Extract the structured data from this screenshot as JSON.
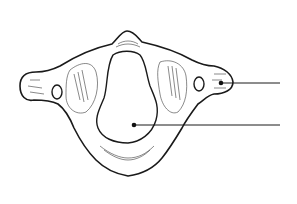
{
  "figure": {
    "style": "black line-art illustration on white",
    "colors": {
      "background": "#ffffff",
      "ink": "#1a1a1a"
    }
  },
  "leaders": [
    {
      "id": "leader-1",
      "points_to": "transverse process",
      "dot": [
        221,
        83
      ],
      "line_end": [
        280,
        83
      ],
      "label": ""
    },
    {
      "id": "leader-2",
      "points_to": "vertebral foramen",
      "dot": [
        134,
        125
      ],
      "line_end": [
        280,
        125
      ],
      "label": ""
    }
  ]
}
